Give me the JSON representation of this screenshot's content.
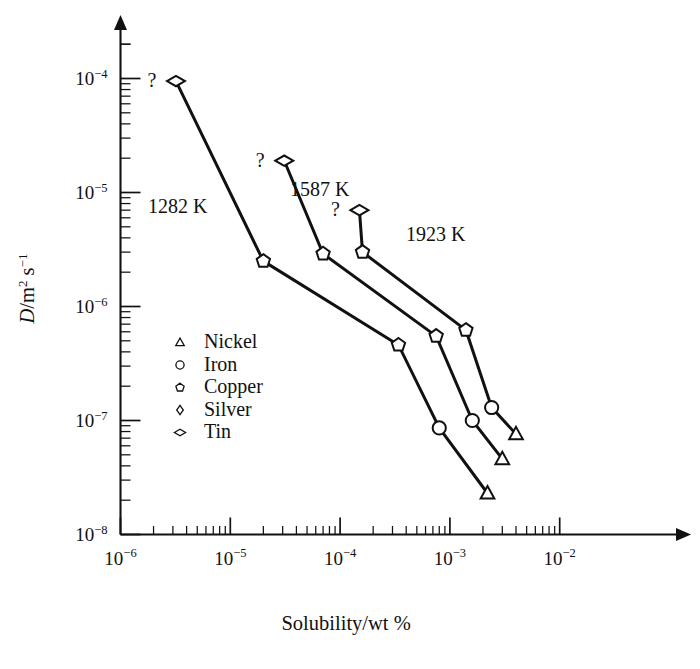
{
  "figure": {
    "background_color": "#ffffff",
    "ink_color": "#111111"
  },
  "chart_data": {
    "type": "line",
    "title": "",
    "subtitle": "",
    "xlabel": "Solubility/wt %",
    "ylabel": "D/m2 s-1",
    "ylabel_parts": {
      "symbol": "D",
      "slash": "/m",
      "sup1": "2",
      "mid": " s",
      "sup2": "−1"
    },
    "xscale": "log",
    "yscale": "log",
    "xlim": [
      1e-06,
      0.01
    ],
    "ylim": [
      1e-08,
      0.0002
    ],
    "grid": false,
    "legend_position": "inside-left-middle",
    "xticks": [
      {
        "value": 1e-06,
        "mantissa": "10",
        "exponent": "−6"
      },
      {
        "value": 1e-05,
        "mantissa": "10",
        "exponent": "−5"
      },
      {
        "value": 0.0001,
        "mantissa": "10",
        "exponent": "−4"
      },
      {
        "value": 0.001,
        "mantissa": "10",
        "exponent": "−3"
      },
      {
        "value": 0.01,
        "mantissa": "10",
        "exponent": "−2"
      }
    ],
    "yticks": [
      {
        "value": 0.0001,
        "mantissa": "10",
        "exponent": "−4"
      },
      {
        "value": 1e-05,
        "mantissa": "10",
        "exponent": "−5"
      },
      {
        "value": 1e-06,
        "mantissa": "10",
        "exponent": "−6"
      },
      {
        "value": 1e-07,
        "mantissa": "10",
        "exponent": "−7"
      },
      {
        "value": 1e-08,
        "mantissa": "10",
        "exponent": "−8"
      }
    ],
    "legend": [
      {
        "label": "Nickel",
        "marker": "triangle"
      },
      {
        "label": "Iron",
        "marker": "circle"
      },
      {
        "label": "Copper",
        "marker": "pentagon"
      },
      {
        "label": "Silver",
        "marker": "diamond"
      },
      {
        "label": "Tin",
        "marker": "flat-diamond"
      }
    ],
    "annotations": [
      {
        "text": "?",
        "series": "1282 K",
        "near_point": [
          3.2e-06,
          9.5e-05
        ]
      },
      {
        "text": "?",
        "series": "1587 K",
        "near_point": [
          3.1e-05,
          1.9e-05
        ]
      },
      {
        "text": "?",
        "series": "1923 K",
        "near_point": [
          0.00015,
          7e-06
        ]
      }
    ],
    "series": [
      {
        "name": "1282 K",
        "label": "1282 K",
        "points": [
          {
            "x": 3.2e-06,
            "y": 9.5e-05,
            "marker": "flat-diamond",
            "element": "Tin"
          },
          {
            "x": 2e-05,
            "y": 2.5e-06,
            "marker": "pentagon",
            "element": "Copper"
          },
          {
            "x": 0.00034,
            "y": 4.6e-07,
            "marker": "pentagon",
            "element": "Copper"
          },
          {
            "x": 0.0008,
            "y": 8.6e-08,
            "marker": "circle",
            "element": "Iron"
          },
          {
            "x": 0.0022,
            "y": 2.3e-08,
            "marker": "triangle",
            "element": "Nickel"
          }
        ]
      },
      {
        "name": "1587 K",
        "label": "1587 K",
        "points": [
          {
            "x": 3.1e-05,
            "y": 1.9e-05,
            "marker": "flat-diamond",
            "element": "Tin"
          },
          {
            "x": 7e-05,
            "y": 2.9e-06,
            "marker": "pentagon",
            "element": "Copper"
          },
          {
            "x": 0.00075,
            "y": 5.5e-07,
            "marker": "pentagon",
            "element": "Copper"
          },
          {
            "x": 0.0016,
            "y": 1e-07,
            "marker": "circle",
            "element": "Iron"
          },
          {
            "x": 0.003,
            "y": 4.6e-08,
            "marker": "triangle",
            "element": "Nickel"
          }
        ]
      },
      {
        "name": "1923 K",
        "label": "1923 K",
        "points": [
          {
            "x": 0.00015,
            "y": 7e-06,
            "marker": "flat-diamond",
            "element": "Tin"
          },
          {
            "x": 0.00016,
            "y": 3e-06,
            "marker": "pentagon",
            "element": "Copper"
          },
          {
            "x": 0.0014,
            "y": 6.2e-07,
            "marker": "pentagon",
            "element": "Copper"
          },
          {
            "x": 0.0024,
            "y": 1.3e-07,
            "marker": "circle",
            "element": "Iron"
          },
          {
            "x": 0.004,
            "y": 7.6e-08,
            "marker": "triangle",
            "element": "Nickel"
          }
        ]
      }
    ]
  }
}
